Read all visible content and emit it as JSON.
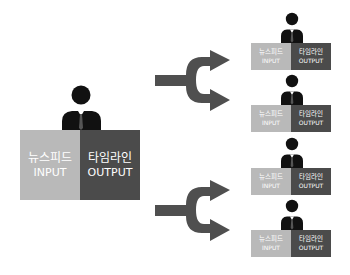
{
  "colors": {
    "input_block": "#b9b9b9",
    "output_block": "#4b4b4b",
    "arrow": "#4f4f4f",
    "person": "#111111",
    "text": "#ffffff"
  },
  "source": {
    "person_icon": "person-icon",
    "input": {
      "ko": "뉴스피드",
      "en": "INPUT"
    },
    "output": {
      "ko": "타임라인",
      "en": "OUTPUT"
    }
  },
  "arrows": [
    {
      "icon": "fork-arrow-icon",
      "label": "split-top"
    },
    {
      "icon": "fork-arrow-icon",
      "label": "split-bottom"
    }
  ],
  "targets": [
    {
      "person_icon": "person-icon",
      "input": {
        "ko": "뉴스피드",
        "en": "INPUT"
      },
      "output": {
        "ko": "타임라인",
        "en": "OUTPUT"
      }
    },
    {
      "person_icon": "person-icon",
      "input": {
        "ko": "뉴스피드",
        "en": "INPUT"
      },
      "output": {
        "ko": "타임라인",
        "en": "OUTPUT"
      }
    },
    {
      "person_icon": "person-icon",
      "input": {
        "ko": "뉴스피드",
        "en": "INPUT"
      },
      "output": {
        "ko": "타임라인",
        "en": "OUTPUT"
      }
    },
    {
      "person_icon": "person-icon",
      "input": {
        "ko": "뉴스피드",
        "en": "INPUT"
      },
      "output": {
        "ko": "타임라인",
        "en": "OUTPUT"
      }
    }
  ]
}
